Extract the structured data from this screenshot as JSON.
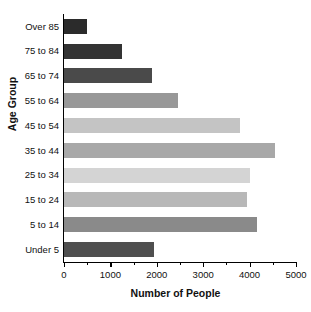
{
  "chart_data": {
    "type": "bar",
    "orientation": "horizontal",
    "title": "",
    "xlabel": "Number of People",
    "ylabel": "Age Group",
    "categories": [
      "Over 85",
      "75 to 84",
      "65 to 74",
      "55 to 64",
      "45 to 54",
      "35 to 44",
      "25 to 34",
      "15 to 24",
      "5 to 14",
      "Under 5"
    ],
    "values": [
      500,
      1250,
      1900,
      2450,
      3800,
      4550,
      4000,
      3950,
      4150,
      1950
    ],
    "bar_colors": [
      "#2b2b2b",
      "#333333",
      "#4a4a4a",
      "#989898",
      "#c4c4c4",
      "#a8a8a8",
      "#d4d4d4",
      "#b8b8b8",
      "#8a8a8a",
      "#4f4f4f"
    ],
    "xlim": [
      0,
      5000
    ],
    "xticks": [
      0,
      1000,
      2000,
      3000,
      4000,
      5000
    ],
    "xtick_labels": [
      "0",
      "1000",
      "2000",
      "3000",
      "4000",
      "5000"
    ],
    "minor_ticks": [
      500,
      1500,
      2500,
      3500,
      4500
    ],
    "grid": false,
    "legend": false
  }
}
